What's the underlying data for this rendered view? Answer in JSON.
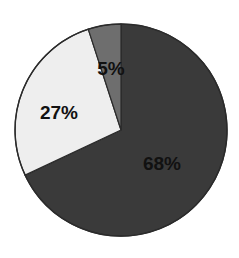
{
  "chart_data": {
    "type": "pie",
    "title": "",
    "subtitle": "",
    "xlabel": "",
    "ylabel": "",
    "grid": false,
    "legend": "none",
    "start_angle_deg": 0,
    "direction": "clockwise",
    "center": {
      "x": 121,
      "y": 130
    },
    "radius": 106,
    "background": "#ffffff",
    "outline_color": "#2b2b2b",
    "label_color": "#111111",
    "categories": [
      "68%",
      "27%",
      "5%"
    ],
    "values": [
      68,
      27,
      5
    ],
    "slices": [
      {
        "label": "68%",
        "value": 68,
        "color": "#3a3a3a",
        "start_deg": 0,
        "end_deg": 244.8,
        "label_x": 162,
        "label_y": 163
      },
      {
        "label": "27%",
        "value": 27,
        "color": "#eeeeee",
        "start_deg": 244.8,
        "end_deg": 342.0,
        "label_x": 59,
        "label_y": 112
      },
      {
        "label": "5%",
        "value": 5,
        "color": "#6e6e6e",
        "start_deg": 342.0,
        "end_deg": 360.0,
        "label_x": 111,
        "label_y": 68
      }
    ]
  }
}
